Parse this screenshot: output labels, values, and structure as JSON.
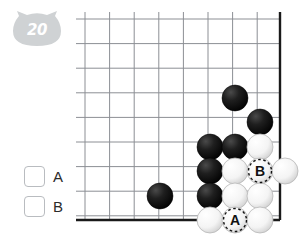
{
  "badge": {
    "number": "20",
    "icon": "cat-head-badge",
    "color": "#cfd2d4",
    "text_color": "#ffffff"
  },
  "choices": [
    {
      "id": "A",
      "label": "A",
      "checked": false
    },
    {
      "id": "B",
      "label": "B",
      "checked": false
    }
  ],
  "board": {
    "type": "go-board-corner",
    "origin_x": 85,
    "origin_y": 19,
    "spacing": 24.6,
    "cols": 8,
    "rows": 9,
    "edge_right_x": 280,
    "edge_bottom_y": 220,
    "line_color": "#8c8f94",
    "edge_color": "#1a1a1a",
    "background": "#ffffff",
    "stone_radius": 13,
    "black_color": "#131313",
    "white_color": "#fdfdfd",
    "markers": [
      {
        "label": "A",
        "x": 235,
        "y": 220,
        "on": "white-stone"
      },
      {
        "label": "B",
        "x": 260,
        "y": 171,
        "on": "white-stone"
      }
    ],
    "stones": [
      {
        "color": "black",
        "x": 235,
        "y": 98
      },
      {
        "color": "black",
        "x": 260,
        "y": 122
      },
      {
        "color": "black",
        "x": 210,
        "y": 147
      },
      {
        "color": "black",
        "x": 235,
        "y": 147
      },
      {
        "color": "black",
        "x": 210,
        "y": 171
      },
      {
        "color": "black",
        "x": 210,
        "y": 196
      },
      {
        "color": "black",
        "x": 160,
        "y": 196
      },
      {
        "color": "white",
        "x": 260,
        "y": 147
      },
      {
        "color": "white",
        "x": 235,
        "y": 171
      },
      {
        "color": "white",
        "x": 260,
        "y": 171,
        "marker": "B"
      },
      {
        "color": "white",
        "x": 285,
        "y": 171
      },
      {
        "color": "white",
        "x": 235,
        "y": 196
      },
      {
        "color": "white",
        "x": 260,
        "y": 196
      },
      {
        "color": "white",
        "x": 210,
        "y": 220
      },
      {
        "color": "white",
        "x": 235,
        "y": 220,
        "marker": "A"
      },
      {
        "color": "white",
        "x": 260,
        "y": 220
      }
    ]
  }
}
